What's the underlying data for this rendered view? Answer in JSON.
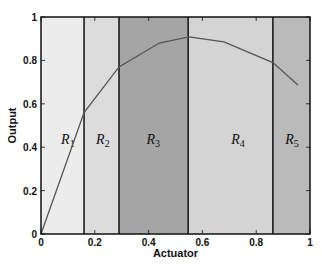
{
  "chart_data": {
    "type": "line",
    "title": "",
    "xlabel": "Actuator",
    "ylabel": "Output",
    "xlim": [
      0,
      1
    ],
    "ylim": [
      0,
      1
    ],
    "xticks": [
      0,
      0.2,
      0.4,
      0.6,
      0.8,
      1
    ],
    "xtick_labels": [
      "0",
      "0.2",
      "0.4",
      "0.6",
      "0.8",
      "1"
    ],
    "yticks": [
      0,
      0.2,
      0.4,
      0.6,
      0.8,
      1
    ],
    "ytick_labels": [
      "0",
      "0.2",
      "0.4",
      "0.6",
      "0.8",
      "1"
    ],
    "grid": false,
    "legend": null,
    "series": [
      {
        "name": "Output",
        "color": "#555555",
        "x": [
          0,
          0.16,
          0.29,
          0.44,
          0.55,
          0.68,
          0.862,
          0.955
        ],
        "y": [
          0,
          0.56,
          0.77,
          0.88,
          0.908,
          0.885,
          0.79,
          0.687
        ]
      }
    ],
    "regions": [
      {
        "label": "R",
        "sub": "1",
        "x0": 0,
        "x1": 0.16,
        "color": "#ececec"
      },
      {
        "label": "R",
        "sub": "2",
        "x0": 0.16,
        "x1": 0.29,
        "color": "#dcdcdc"
      },
      {
        "label": "R",
        "sub": "3",
        "x0": 0.29,
        "x1": 0.547,
        "color": "#a5a5a5"
      },
      {
        "label": "R",
        "sub": "4",
        "x0": 0.547,
        "x1": 0.862,
        "color": "#d4d4d4"
      },
      {
        "label": "R",
        "sub": "5",
        "x0": 0.862,
        "x1": 1,
        "color": "#bababa"
      }
    ],
    "region_label_y": 0.44,
    "region_label_x": [
      0.1,
      0.23,
      0.417,
      0.732,
      0.933
    ]
  }
}
